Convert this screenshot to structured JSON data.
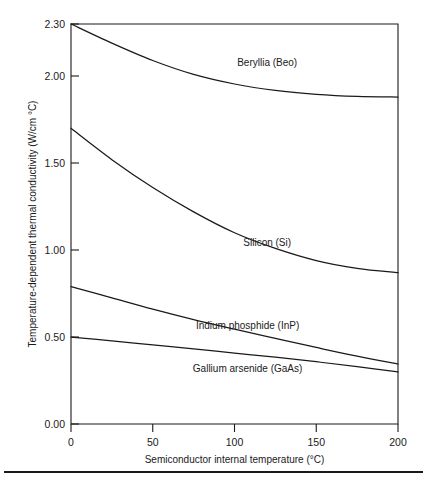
{
  "chart_data": {
    "type": "line",
    "title": "",
    "xlabel": "Semiconductor internal temperature (°C)",
    "ylabel": "Temperature-dependent thermal conductivity (W/cm °C)",
    "xlim": [
      0,
      200
    ],
    "ylim": [
      0.0,
      2.3
    ],
    "xticks": [
      0,
      50,
      100,
      150,
      200
    ],
    "xtick_labels": [
      "0",
      "50",
      "100",
      "150",
      "200"
    ],
    "yticks": [
      0.0,
      0.5,
      1.0,
      1.5,
      2.0,
      2.3
    ],
    "ytick_labels": [
      "0.00",
      "0.50",
      "1.00",
      "1.50",
      "2.00",
      "2.30"
    ],
    "grid": false,
    "legend_position": "inline-annotations",
    "x": [
      0,
      25,
      50,
      75,
      100,
      125,
      150,
      175,
      200
    ],
    "series": [
      {
        "name": "Beryllia (BeO)",
        "label": "Beryllia (Beo)",
        "values": [
          2.3,
          2.19,
          2.09,
          2.01,
          1.955,
          1.918,
          1.896,
          1.884,
          1.88
        ]
      },
      {
        "name": "Silicon (Si)",
        "label": "Silicon (Si)",
        "values": [
          1.7,
          1.52,
          1.36,
          1.22,
          1.1,
          1.01,
          0.94,
          0.895,
          0.87
        ]
      },
      {
        "name": "Indium phosphide (InP)",
        "label": "Indium phosphide (InP)",
        "values": [
          0.79,
          0.725,
          0.66,
          0.6,
          0.545,
          0.492,
          0.44,
          0.39,
          0.345
        ]
      },
      {
        "name": "Gallium arsenide (GaAs)",
        "label": "Gallium arsenide (GaAs)",
        "values": [
          0.5,
          0.478,
          0.455,
          0.432,
          0.408,
          0.384,
          0.358,
          0.33,
          0.3
        ]
      }
    ],
    "annotations": [
      {
        "text": "Beryllia (Beo)",
        "x": 120,
        "y": 2.06
      },
      {
        "text": "Silicon (Si)",
        "x": 120,
        "y": 1.025
      },
      {
        "text": "Indium phosphide (InP)",
        "x": 108,
        "y": 0.545
      },
      {
        "text": "Gallium arsenide (GaAs)",
        "x": 108,
        "y": 0.3
      }
    ],
    "colors": {
      "line": "#1a1a1a",
      "axis": "#1a1a1a",
      "background": "#ffffff"
    }
  }
}
